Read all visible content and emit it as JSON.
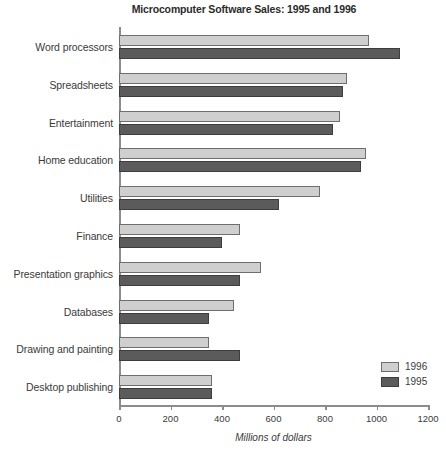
{
  "chart_data": {
    "type": "bar",
    "orientation": "horizontal",
    "title": "Microcomputer Software Sales: 1995 and 1996",
    "xlabel": "Millions of dollars",
    "ylabel": "",
    "xlim": [
      0,
      1200
    ],
    "xticks": [
      0,
      200,
      400,
      600,
      800,
      1000,
      1200
    ],
    "xtick_labels": [
      "0",
      "200",
      "400",
      "600",
      "800",
      "1000",
      "1200"
    ],
    "grid": false,
    "legend_position": "bottom-right",
    "categories": [
      "Word processors",
      "Spreadsheets",
      "Entertainment",
      "Home education",
      "Utilities",
      "Finance",
      "Presentation graphics",
      "Databases",
      "Drawing and painting",
      "Desktop publishing"
    ],
    "series": [
      {
        "name": "1996",
        "color": "#cfcfcf",
        "values": [
          970,
          885,
          860,
          960,
          780,
          470,
          550,
          445,
          350,
          360
        ]
      },
      {
        "name": "1995",
        "color": "#5b5b5b",
        "values": [
          1090,
          870,
          830,
          940,
          620,
          400,
          470,
          350,
          470,
          360
        ]
      }
    ]
  },
  "legend": {
    "entries": [
      {
        "label": "1996",
        "swatch": "light-gray-swatch"
      },
      {
        "label": "1995",
        "swatch": "dark-gray-swatch"
      }
    ]
  }
}
